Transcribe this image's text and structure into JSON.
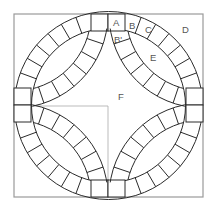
{
  "diagram": {
    "colors": {
      "background": "#ffffff",
      "outline": "#2a2a2a",
      "frame": "#9a9a9a",
      "guide": "#aaaaaa",
      "label": "#555555"
    },
    "labels": {
      "A": "A",
      "B": "B",
      "C": "C",
      "D": "D",
      "E": "E",
      "B_prime": "B'",
      "F": "F"
    },
    "geometry": {
      "frame": {
        "x": 14,
        "y": 14,
        "w": 189,
        "h": 183
      },
      "center": {
        "x": 108.5,
        "y": 105.5
      },
      "outer_ring_radius": 94,
      "inner_ring_radius": 77,
      "segments_per_quarter": 7
    }
  }
}
